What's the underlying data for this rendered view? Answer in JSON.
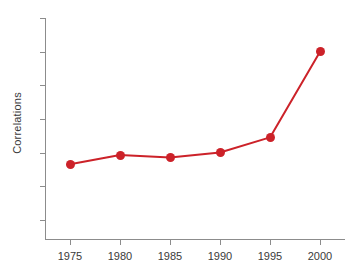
{
  "chart_data": {
    "type": "line",
    "title": "",
    "xlabel": "",
    "ylabel": "Correlations",
    "x": [
      1975,
      1980,
      1985,
      1990,
      1995,
      2000
    ],
    "values": [
      0.133,
      0.1385,
      0.137,
      0.14,
      0.149,
      0.2
    ],
    "series": [
      {
        "name": "Correlations",
        "values": [
          0.133,
          0.1385,
          0.137,
          0.14,
          0.149,
          0.2
        ]
      }
    ],
    "xlim": [
      1972.5,
      2002.5
    ],
    "ylim": [
      0.088,
      0.22
    ],
    "xticks": [
      1975,
      1980,
      1985,
      1990,
      1995,
      2000
    ],
    "xticklabels": [
      "1975",
      "1980",
      "1985",
      "1990",
      "1995",
      "2000"
    ],
    "yticks": [
      0.1,
      0.12,
      0.14,
      0.16,
      0.18,
      0.2,
      0.22
    ],
    "yticklabels": [
      ".10",
      ".12",
      ".14",
      ".16",
      ".18",
      ".20",
      ".22"
    ],
    "grid": false,
    "legend": "none",
    "marker": "circle",
    "line_color": "#cc2229",
    "marker_color": "#cc2229",
    "axis_color": "#8c8c8c",
    "background": "#ffffff"
  },
  "figure": {
    "caption_strip": "",
    "axis_label_y": "Correlations"
  }
}
